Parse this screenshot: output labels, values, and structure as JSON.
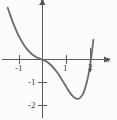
{
  "figure": {
    "kind": "cartesian-graph",
    "background_color": "#fcfcfc",
    "curve_color": "#6b6b6b",
    "axis_color": "#5a5a5a",
    "label_color": "#3a3a3a"
  },
  "axes": {
    "x_label": "x",
    "y_label": "y",
    "x_tick_labels": [
      "-1",
      "1",
      "2"
    ],
    "y_tick_labels": [
      "-1",
      "-2"
    ],
    "x_arrow": true,
    "y_arrow": true
  },
  "chart_data": {
    "type": "line",
    "title": "",
    "xlabel": "x",
    "ylabel": "y",
    "xlim": [
      -1.9,
      2.35
    ],
    "ylim": [
      -2.45,
      2.6
    ],
    "grid": false,
    "legend": null,
    "xticks": [
      -1,
      1,
      2
    ],
    "yticks": [
      -1,
      -2
    ],
    "xticklabels": [
      "-1",
      "1",
      "2"
    ],
    "yticklabels": [
      "-1",
      "-2"
    ],
    "series": [
      {
        "name": "curve",
        "x": [
          -1.45,
          -1.35,
          -1.25,
          -1.15,
          -1.05,
          -0.95,
          -0.85,
          -0.75,
          -0.65,
          -0.55,
          -0.45,
          -0.35,
          -0.25,
          -0.15,
          -0.05,
          0.05,
          0.15,
          0.25,
          0.35,
          0.45,
          0.55,
          0.65,
          0.75,
          0.85,
          0.95,
          1.05,
          1.15,
          1.25,
          1.35,
          1.45,
          1.55,
          1.65,
          1.75,
          1.85,
          1.95,
          2.05,
          2.12
        ],
        "y": [
          2.25,
          1.95,
          1.66,
          1.4,
          1.16,
          0.95,
          0.76,
          0.6,
          0.46,
          0.34,
          0.24,
          0.16,
          0.1,
          0.05,
          0.01,
          -0.03,
          -0.08,
          -0.15,
          -0.24,
          -0.35,
          -0.48,
          -0.62,
          -0.78,
          -0.95,
          -1.12,
          -1.29,
          -1.45,
          -1.58,
          -1.67,
          -1.71,
          -1.68,
          -1.56,
          -1.33,
          -0.97,
          -0.46,
          0.25,
          0.85
        ]
      }
    ]
  }
}
